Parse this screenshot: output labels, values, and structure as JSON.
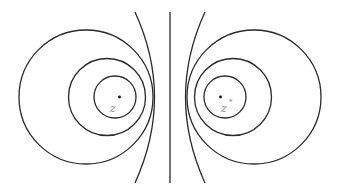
{
  "diagram": {
    "title": "",
    "kind": "apollonian-circles",
    "colors": {
      "line": "#2a2a2a",
      "label": "#8a8a8a",
      "background": "#ffffff"
    },
    "labels": {
      "left_point": "z",
      "right_point": "z",
      "right_point_sup": "*"
    },
    "points": [
      {
        "name": "z",
        "x": 119,
        "y": 97
      },
      {
        "name": "z*",
        "x": 220,
        "y": 97
      }
    ],
    "circles_left": [
      {
        "cx": 86,
        "cy": 97,
        "r": 67
      },
      {
        "cx": 107,
        "cy": 97,
        "r": 38
      },
      {
        "cx": 115,
        "cy": 97,
        "r": 21
      }
    ],
    "circles_right": [
      {
        "cx": 254,
        "cy": 97,
        "r": 67
      },
      {
        "cx": 233,
        "cy": 97,
        "r": 38
      },
      {
        "cx": 225,
        "cy": 97,
        "r": 21
      }
    ],
    "bisector_line": {
      "x": 170,
      "y1": 12,
      "y2": 183
    }
  }
}
